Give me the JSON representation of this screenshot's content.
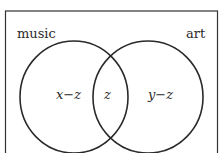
{
  "diagram": {
    "type": "venn",
    "sets": [
      {
        "label": "music"
      },
      {
        "label": "art"
      }
    ],
    "regions": {
      "left_only": "x−z",
      "intersection": "z",
      "right_only": "y−z"
    },
    "colors": {
      "stroke": "#2a2a2a",
      "background": "#ffffff"
    }
  }
}
